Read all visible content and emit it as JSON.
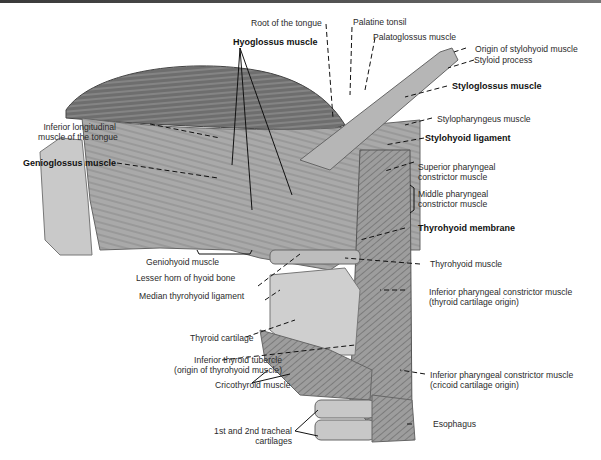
{
  "figure": {
    "labels": {
      "root_of_tongue": "Root of the tongue",
      "palatine_tonsil": "Palatine tonsil",
      "hyoglossus": "Hyoglossus muscle",
      "palatoglossus": "Palatoglossus muscle",
      "origin_stylohyoid": "Origin of stylohyoid muscle",
      "styloid_process": "Styloid process",
      "styloglossus": "Styloglossus muscle",
      "stylopharyngeus": "Stylopharyngeus muscle",
      "stylohyoid_ligament": "Stylohyoid ligament",
      "inferior_longitudinal_1": "Inferior longitudinal",
      "inferior_longitudinal_2": "muscle of the tongue",
      "genioglossus": "Genioglossus muscle",
      "superior_pharyngeal_1": "Superior pharyngeal",
      "superior_pharyngeal_2": "constrictor muscle",
      "middle_pharyngeal_1": "Middle pharyngeal",
      "middle_pharyngeal_2": "constrictor muscle",
      "thyrohyoid_membrane": "Thyrohyoid membrane",
      "geniohyoid": "Geniohyoid muscle",
      "lesser_horn": "Lesser horn of hyoid bone",
      "thyrohyoid_muscle": "Thyrohyoid muscle",
      "median_thyrohyoid": "Median thyrohyoid ligament",
      "inf_phar_thyroid_1": "Inferior pharyngeal constrictor muscle",
      "inf_phar_thyroid_2": "(thyroid cartilage origin)",
      "thyroid_cartilage": "Thyroid cartilage",
      "inferior_thyroid_tubercle_1": "Inferior thyroid tubercle",
      "inferior_thyroid_tubercle_2": "(origin of thyrohyoid muscle)",
      "inf_phar_cricoid_1": "Inferior pharyngeal constrictor muscle",
      "inf_phar_cricoid_2": "(cricoid cartilage origin)",
      "cricothyroid": "Cricothyroid muscle",
      "tracheal_1": "1st and 2nd tracheal",
      "tracheal_2": "cartilages",
      "esophagus": "Esophagus"
    }
  }
}
